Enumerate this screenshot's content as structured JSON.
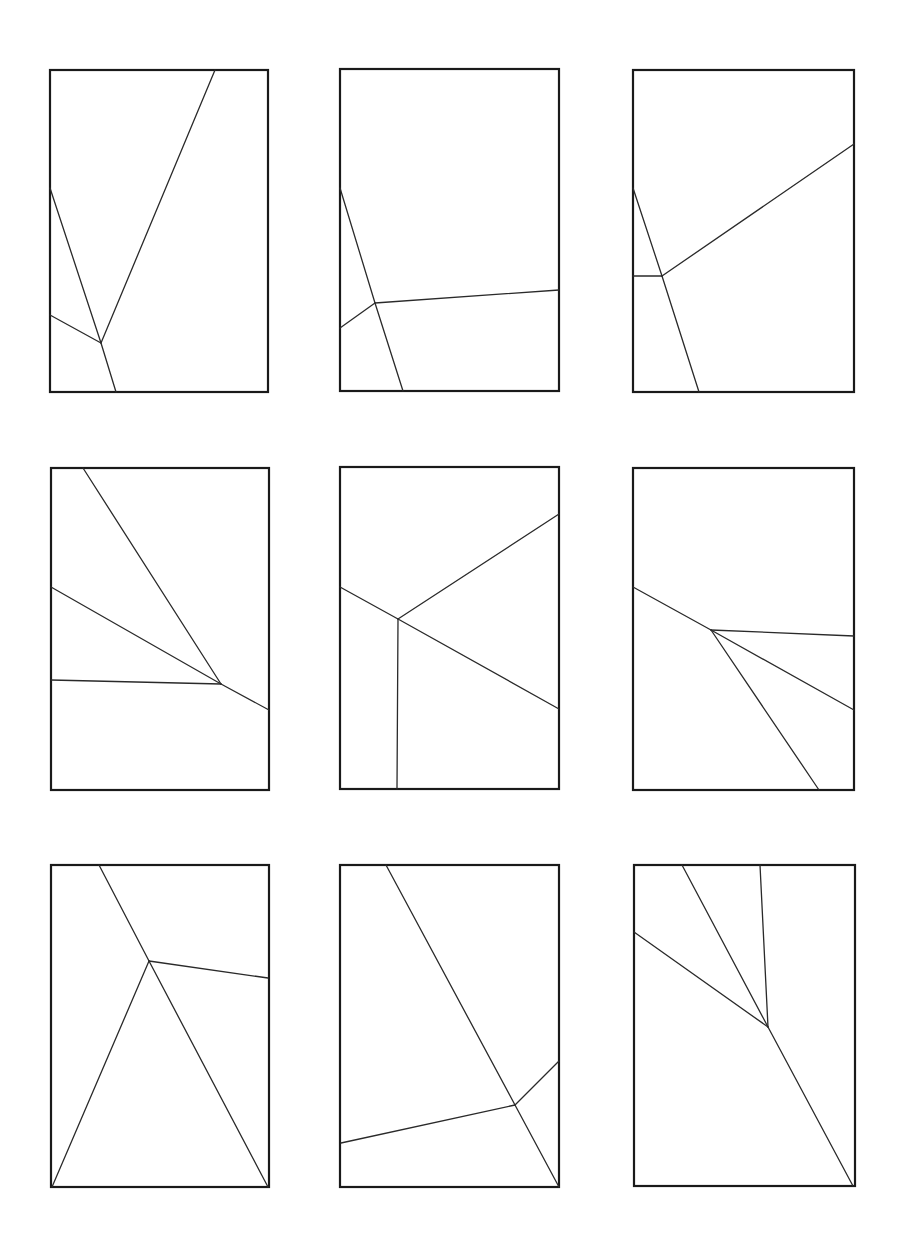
{
  "figure": {
    "stroke_color": "#1a1a1a",
    "background": "#ffffff",
    "panels": [
      {
        "id": "panel-1",
        "frame": {
          "x1": 50,
          "y1": 70,
          "x2": 268,
          "y2": 392
        },
        "segments": [
          [
            215,
            70,
            101,
            343
          ],
          [
            50,
            188,
            101,
            343
          ],
          [
            50,
            315,
            101,
            343
          ],
          [
            101,
            343,
            116,
            392
          ]
        ]
      },
      {
        "id": "panel-2",
        "frame": {
          "x1": 340,
          "y1": 69,
          "x2": 559,
          "y2": 391
        },
        "segments": [
          [
            340,
            188,
            375,
            303
          ],
          [
            375,
            303,
            403,
            391
          ],
          [
            340,
            328,
            375,
            303
          ],
          [
            375,
            303,
            559,
            290
          ]
        ]
      },
      {
        "id": "panel-3",
        "frame": {
          "x1": 633,
          "y1": 70,
          "x2": 854,
          "y2": 392
        },
        "segments": [
          [
            633,
            188,
            662,
            276
          ],
          [
            662,
            276,
            699,
            392
          ],
          [
            633,
            276,
            662,
            276
          ],
          [
            662,
            276,
            854,
            144
          ]
        ]
      },
      {
        "id": "panel-4",
        "frame": {
          "x1": 51,
          "y1": 468,
          "x2": 269,
          "y2": 790
        },
        "segments": [
          [
            83,
            468,
            221,
            684
          ],
          [
            51,
            587,
            221,
            684
          ],
          [
            51,
            680,
            221,
            684
          ],
          [
            221,
            684,
            269,
            710
          ]
        ]
      },
      {
        "id": "panel-5",
        "frame": {
          "x1": 340,
          "y1": 467,
          "x2": 559,
          "y2": 789
        },
        "segments": [
          [
            340,
            587,
            398,
            619
          ],
          [
            398,
            619,
            559,
            514
          ],
          [
            398,
            619,
            559,
            709
          ],
          [
            398,
            619,
            397,
            789
          ]
        ]
      },
      {
        "id": "panel-6",
        "frame": {
          "x1": 633,
          "y1": 468,
          "x2": 854,
          "y2": 790
        },
        "segments": [
          [
            633,
            587,
            711,
            630
          ],
          [
            711,
            630,
            854,
            636
          ],
          [
            711,
            630,
            854,
            710
          ],
          [
            711,
            630,
            819,
            790
          ]
        ]
      },
      {
        "id": "panel-7",
        "frame": {
          "x1": 51,
          "y1": 865,
          "x2": 269,
          "y2": 1187
        },
        "segments": [
          [
            99,
            865,
            149,
            961
          ],
          [
            149,
            961,
            268,
            978
          ],
          [
            149,
            961,
            52,
            1187
          ],
          [
            149,
            961,
            268,
            1187
          ]
        ]
      },
      {
        "id": "panel-8",
        "frame": {
          "x1": 340,
          "y1": 865,
          "x2": 559,
          "y2": 1187
        },
        "segments": [
          [
            386,
            865,
            515,
            1105
          ],
          [
            515,
            1105,
            559,
            1061
          ],
          [
            515,
            1105,
            341,
            1143
          ],
          [
            515,
            1105,
            559,
            1187
          ]
        ]
      },
      {
        "id": "panel-9",
        "frame": {
          "x1": 634,
          "y1": 865,
          "x2": 855,
          "y2": 1186
        },
        "segments": [
          [
            682,
            865,
            768,
            1027
          ],
          [
            760,
            865,
            768,
            1027
          ],
          [
            634,
            932,
            768,
            1027
          ],
          [
            768,
            1027,
            853,
            1186
          ]
        ]
      }
    ]
  }
}
